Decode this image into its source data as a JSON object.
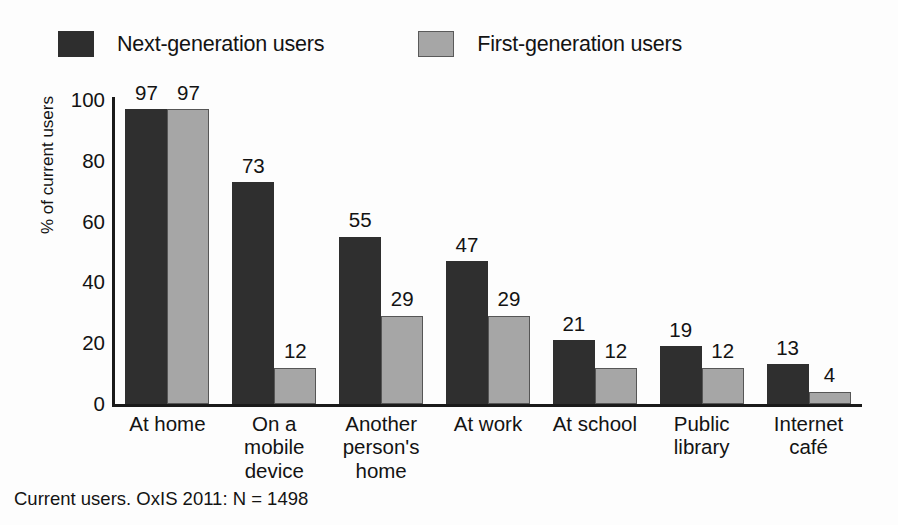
{
  "chart_data": {
    "type": "bar",
    "title": "",
    "xlabel": "",
    "ylabel": "% of current users",
    "ylim": [
      0,
      100
    ],
    "yticks": [
      100,
      80,
      60,
      40,
      20,
      0
    ],
    "grid": false,
    "legend_position": "top-left",
    "categories": [
      "At home",
      "On a mobile device",
      "Another person's home",
      "At work",
      "At school",
      "Public library",
      "Internet café"
    ],
    "category_lines": [
      [
        "At home"
      ],
      [
        "On a",
        "mobile",
        "device"
      ],
      [
        "Another",
        "person's",
        "home"
      ],
      [
        "At work"
      ],
      [
        "At school"
      ],
      [
        "Public",
        "library"
      ],
      [
        "Internet",
        "café"
      ]
    ],
    "series": [
      {
        "name": "Next-generation users",
        "color": "#2f2f2f",
        "values": [
          97,
          73,
          55,
          47,
          21,
          19,
          13
        ]
      },
      {
        "name": "First-generation users",
        "color": "#a6a6a6",
        "values": [
          97,
          12,
          29,
          29,
          12,
          12,
          4
        ]
      }
    ],
    "annotation": "Current users. OxIS 2011: N = 1498"
  },
  "legend": {
    "items": [
      {
        "label": "Next-generation users",
        "swatch": "dark"
      },
      {
        "label": "First-generation users",
        "swatch": "light"
      }
    ]
  },
  "footnote": "Current users. OxIS 2011: N = 1498"
}
